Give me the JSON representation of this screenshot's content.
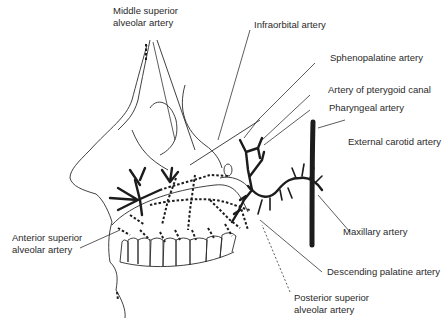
{
  "figure": {
    "colors": {
      "ink": "#1c1c1c",
      "background": "#ffffff"
    }
  },
  "labels": {
    "middle_superior_alveolar": [
      "Middle superior",
      "alveolar artery"
    ],
    "infraorbital": "Infraorbital artery",
    "sphenopalatine": "Sphenopalatine artery",
    "pterygoid_canal": "Artery of pterygoid canal",
    "pharyngeal": "Pharyngeal artery",
    "external_carotid": "External carotid artery",
    "maxillary": "Maxillary artery",
    "descending_palatine": "Descending palatine artery",
    "posterior_superior_alveolar": [
      "Posterior superior",
      "alveolar artery"
    ],
    "anterior_superior_alveolar": [
      "Anterior superior",
      "alveolar artery"
    ]
  }
}
